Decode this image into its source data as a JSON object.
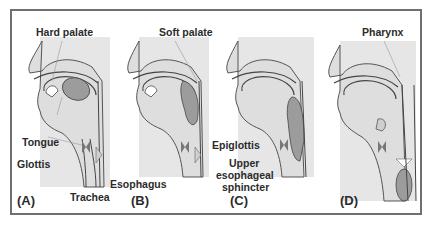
{
  "figure": {
    "panels": [
      {
        "id": "(A)",
        "title": "Hard palate",
        "labels": [
          "Tongue",
          "Glottis",
          "Trachea",
          "Esophagus"
        ]
      },
      {
        "id": "(B)",
        "title": "Soft palate",
        "labels": []
      },
      {
        "id": "(C)",
        "title": "",
        "labels": [
          "Epiglottis",
          "Upper",
          "esophageal",
          "sphincter"
        ]
      },
      {
        "id": "(D)",
        "title": "Pharynx",
        "labels": []
      }
    ],
    "colors": {
      "frame": "#6f6f6f",
      "tissue": "#e3e3e3",
      "outline": "#4a4a4a",
      "bolus": "#9a9a9a",
      "text": "#2b2b2b"
    }
  }
}
